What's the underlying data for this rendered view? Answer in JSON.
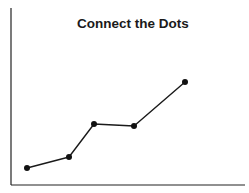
{
  "chart_data": {
    "type": "line",
    "title": "Connect the Dots",
    "xlabel": "",
    "ylabel": "",
    "x": [
      1,
      2,
      3,
      4,
      5
    ],
    "values": [
      1.0,
      1.6,
      3.4,
      3.3,
      6.0
    ],
    "series": [
      {
        "name": "",
        "values": [
          1.0,
          1.6,
          3.4,
          3.3,
          6.0
        ]
      }
    ],
    "grid": false,
    "legend": null,
    "xlim": [
      0,
      6
    ],
    "ylim": [
      0,
      9.5
    ],
    "ticks_shown": false,
    "markers": true,
    "line_color": "#1a1a1a",
    "marker_color": "#111111"
  },
  "pixel_points": [
    [
      27,
      168
    ],
    [
      69,
      157
    ],
    [
      94,
      124
    ],
    [
      134,
      126
    ],
    [
      185,
      82
    ]
  ]
}
